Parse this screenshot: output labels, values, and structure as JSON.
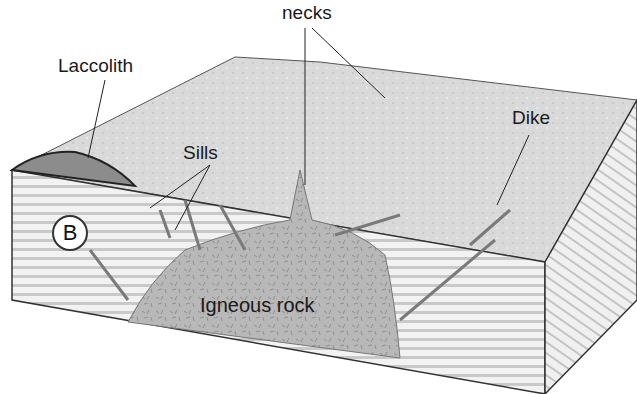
{
  "diagram": {
    "labels": {
      "necks": "necks",
      "laccolith": "Laccolith",
      "sills": "Sills",
      "dike": "Dike",
      "igneous_rock": "Igneous rock"
    },
    "badge": "B",
    "colors": {
      "surface": "#d6d6d6",
      "strata_light": "#eeeeee",
      "strata_dark": "#9a9a9a",
      "igneous": "#b4b4b4",
      "laccolith": "#8c8c8c",
      "outline": "#333333"
    }
  }
}
